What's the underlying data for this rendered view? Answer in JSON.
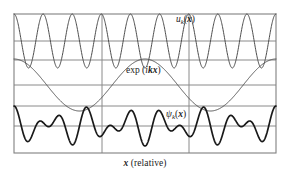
{
  "figure": {
    "background_color": "#ffffff",
    "frame": {
      "stroke_color": "#808080",
      "stroke_width": 1.1,
      "left": 14,
      "top": 14,
      "right": 276,
      "bottom": 153
    },
    "grid": {
      "stroke_color": "#8a8a8a",
      "stroke_width": 1.0,
      "vertical_x": [
        102,
        189
      ],
      "horizontal_y": [
        41,
        60,
        85,
        106,
        126
      ]
    },
    "axis_caption": {
      "variable": "x",
      "text": " (relative)"
    },
    "labels": {
      "top": {
        "fn": "u",
        "sub": "k",
        "arg": "x",
        "open": "(",
        "close": ")"
      },
      "middle": {
        "fn": "exp",
        "space": " (",
        "i": "i",
        "k": "k",
        "x": "x",
        "close": ")"
      },
      "bottom": {
        "fn": "ψ",
        "sub": "k",
        "arg": "x",
        "open": "(",
        "close": ")"
      }
    }
  },
  "chart_data": {
    "type": "line",
    "title": "",
    "xlabel": "x (relative)",
    "ylabel": "",
    "grid": true,
    "legend": "inline-annotations",
    "x_domain": [
      0,
      3
    ],
    "x_tick_labels": [],
    "y_tick_labels": [],
    "axis_note": "three stacked panels sharing one x axis; vertical gridlines mark lattice period boundaries at x = 1 and x = 2",
    "series": [
      {
        "name": "u_k(x)",
        "label": "u_k(x)",
        "panel": "top",
        "description": "lattice-periodic Bloch amplitude: cosine with 3 oscillations per lattice period",
        "color": "#4d4d4d",
        "stroke_width": 1.0,
        "zero_line_y": 41,
        "amplitude_px": 27,
        "cycles_per_period": 3,
        "phase": "maximum at x=0 region start",
        "formula": "cos(2*pi*3*x)"
      },
      {
        "name": "exp(ikx)",
        "label": "exp (ikx)",
        "panel": "middle",
        "description": "slowly varying plane-wave envelope (real part), about 2/3 of a cycle per lattice period",
        "color": "#4d4d4d",
        "stroke_width": 1.0,
        "zero_line_y": 85,
        "amplitude_px": 26,
        "cycles_per_period": 0.6667,
        "phase": "maximum near left frame edge",
        "formula": "cos(2*pi*0.6667*x)"
      },
      {
        "name": "psi_k(x)",
        "label": "ψ_k(x)",
        "panel": "bottom",
        "description": "Bloch wavefunction = product of periodic amplitude and plane-wave envelope",
        "color": "#1a1a1a",
        "stroke_width": 1.7,
        "zero_line_y": 126,
        "amplitude_px": 20,
        "formula": "cos(2*pi*3*x) * cos(2*pi*0.6667*x)"
      }
    ]
  }
}
